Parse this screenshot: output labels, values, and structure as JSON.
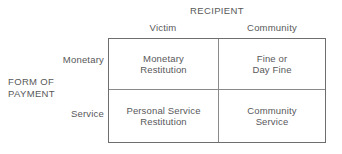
{
  "figure": {
    "column_axis_title": "RECIPIENT",
    "row_axis_title_line1": "FORM OF",
    "row_axis_title_line2": "PAYMENT",
    "column_headers": [
      {
        "label": "Victim"
      },
      {
        "label": "Community"
      }
    ],
    "row_headers": [
      {
        "label": "Monetary"
      },
      {
        "label": "Service"
      }
    ],
    "cells": [
      {
        "row": "Monetary",
        "column": "Victim",
        "line1": "Monetary",
        "line2": "Restitution"
      },
      {
        "row": "Monetary",
        "column": "Community",
        "line1": "Fine or",
        "line2": "Day Fine"
      },
      {
        "row": "Service",
        "column": "Victim",
        "line1": "Personal Service",
        "line2": "Restitution"
      },
      {
        "row": "Service",
        "column": "Community",
        "line1": "Community",
        "line2": "Service"
      }
    ],
    "colors": {
      "text": "#58585a",
      "outer_border": "#6e6e70",
      "inner_border": "#8a8a8c",
      "background": "#ffffff"
    }
  }
}
